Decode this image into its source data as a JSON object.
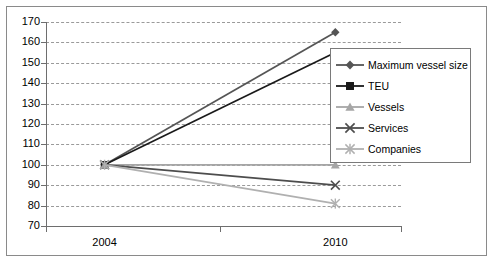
{
  "chart_data": {
    "type": "line",
    "title": "",
    "subtitle": "",
    "xlabel": "",
    "ylabel": "",
    "categories": [
      "2004",
      "2010"
    ],
    "x": [
      2004,
      2010
    ],
    "ylim": [
      70,
      170
    ],
    "ytick_step": 10,
    "yticks": [
      170,
      160,
      150,
      140,
      130,
      120,
      110,
      100,
      90,
      80,
      70
    ],
    "ytick_labels": [
      "170",
      "160",
      "150",
      "140",
      "130",
      "120",
      "110",
      "100",
      "90",
      "80",
      "70"
    ],
    "grid": true,
    "grid_style": "dashed-horizontal",
    "legend_position": "inside-right-top",
    "series": [
      {
        "name": "Maximum vessel size",
        "values": [
          100,
          165
        ],
        "marker": "diamond",
        "color": "#555555"
      },
      {
        "name": "TEU",
        "values": [
          100,
          155
        ],
        "marker": "square",
        "color": "#1a1a1a"
      },
      {
        "name": "Vessels",
        "values": [
          100,
          100
        ],
        "marker": "triangle",
        "color": "#a6a6a6"
      },
      {
        "name": "Services",
        "values": [
          100,
          90
        ],
        "marker": "x",
        "color": "#4d4d4d"
      },
      {
        "name": "Companies",
        "values": [
          100,
          81
        ],
        "marker": "asterisk",
        "color": "#b0b0b0"
      }
    ]
  },
  "legend": {
    "entries": [
      {
        "label": "Maximum vessel size"
      },
      {
        "label": "TEU"
      },
      {
        "label": "Vessels"
      },
      {
        "label": "Services"
      },
      {
        "label": "Companies"
      }
    ]
  },
  "colors": {
    "axis": "#6e6e6e",
    "grid": "#9a9a9a",
    "frame": "#8a8a8a",
    "background": "#ffffff",
    "text": "#000000"
  }
}
